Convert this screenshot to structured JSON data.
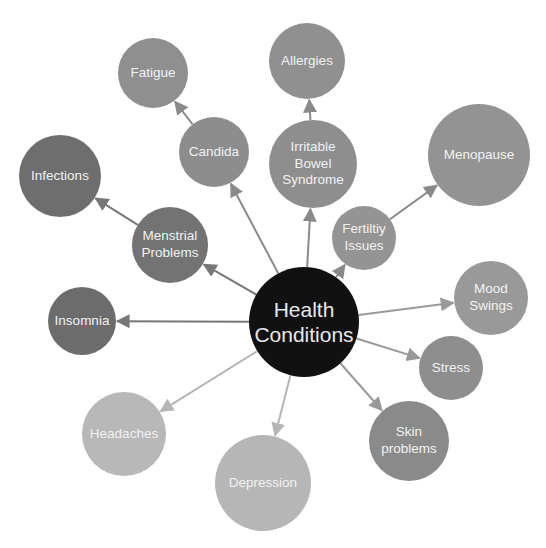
{
  "diagram": {
    "type": "mind-map",
    "center": {
      "id": "health",
      "label": "Health\nConditions",
      "x": 304,
      "y": 322,
      "r": 55,
      "color": "#111111"
    },
    "nodes": [
      {
        "id": "fatigue",
        "label": "Fatigue",
        "x": 153,
        "y": 73,
        "r": 35,
        "color": "#8f8f8f"
      },
      {
        "id": "allergies",
        "label": "Allergies",
        "x": 307,
        "y": 61,
        "r": 38,
        "color": "#909090"
      },
      {
        "id": "candida",
        "label": "Candida",
        "x": 214,
        "y": 152,
        "r": 35,
        "color": "#8d8d8d"
      },
      {
        "id": "ibs",
        "label": "Irritable\nBowel\nSyndrome",
        "x": 313,
        "y": 164,
        "r": 44,
        "color": "#8e8e8e"
      },
      {
        "id": "menopause",
        "label": "Menopause",
        "x": 479,
        "y": 155,
        "r": 51,
        "color": "#939393"
      },
      {
        "id": "infections",
        "label": "Infections",
        "x": 60,
        "y": 176,
        "r": 41,
        "color": "#6e6e6e"
      },
      {
        "id": "menstrial",
        "label": "Menstrial\nProblems",
        "x": 170,
        "y": 245,
        "r": 38,
        "color": "#737373"
      },
      {
        "id": "fertility",
        "label": "Fertiltiy\nIssues",
        "x": 364,
        "y": 238,
        "r": 32,
        "color": "#949494"
      },
      {
        "id": "insomnia",
        "label": "Insomnia",
        "x": 82,
        "y": 321,
        "r": 34,
        "color": "#6c6c6c"
      },
      {
        "id": "mood",
        "label": "Mood\nSwings",
        "x": 491,
        "y": 298,
        "r": 37,
        "color": "#999999"
      },
      {
        "id": "stress",
        "label": "Stress",
        "x": 451,
        "y": 368,
        "r": 32,
        "color": "#8e8e8e"
      },
      {
        "id": "skin",
        "label": "Skin\nproblems",
        "x": 409,
        "y": 441,
        "r": 40,
        "color": "#8a8a8a"
      },
      {
        "id": "headaches",
        "label": "Headaches",
        "x": 124,
        "y": 434,
        "r": 42,
        "color": "#b8b8b8"
      },
      {
        "id": "depression",
        "label": "Depression",
        "x": 263,
        "y": 483,
        "r": 48,
        "color": "#b6b6b6"
      }
    ],
    "edges": [
      {
        "from": "health",
        "to": "candida",
        "color": "#8a8a8a"
      },
      {
        "from": "candida",
        "to": "fatigue",
        "color": "#8a8a8a"
      },
      {
        "from": "health",
        "to": "ibs",
        "color": "#8a8a8a"
      },
      {
        "from": "ibs",
        "to": "allergies",
        "color": "#8a8a8a"
      },
      {
        "from": "health",
        "to": "fertility",
        "color": "#8a8a8a"
      },
      {
        "from": "fertility",
        "to": "menopause",
        "color": "#8a8a8a"
      },
      {
        "from": "health",
        "to": "menstrial",
        "color": "#777777"
      },
      {
        "from": "menstrial",
        "to": "infections",
        "color": "#777777"
      },
      {
        "from": "health",
        "to": "insomnia",
        "color": "#777777"
      },
      {
        "from": "health",
        "to": "mood",
        "color": "#999999"
      },
      {
        "from": "health",
        "to": "stress",
        "color": "#999999"
      },
      {
        "from": "health",
        "to": "skin",
        "color": "#999999"
      },
      {
        "from": "health",
        "to": "headaches",
        "color": "#b5b5b5"
      },
      {
        "from": "health",
        "to": "depression",
        "color": "#b5b5b5"
      }
    ]
  }
}
